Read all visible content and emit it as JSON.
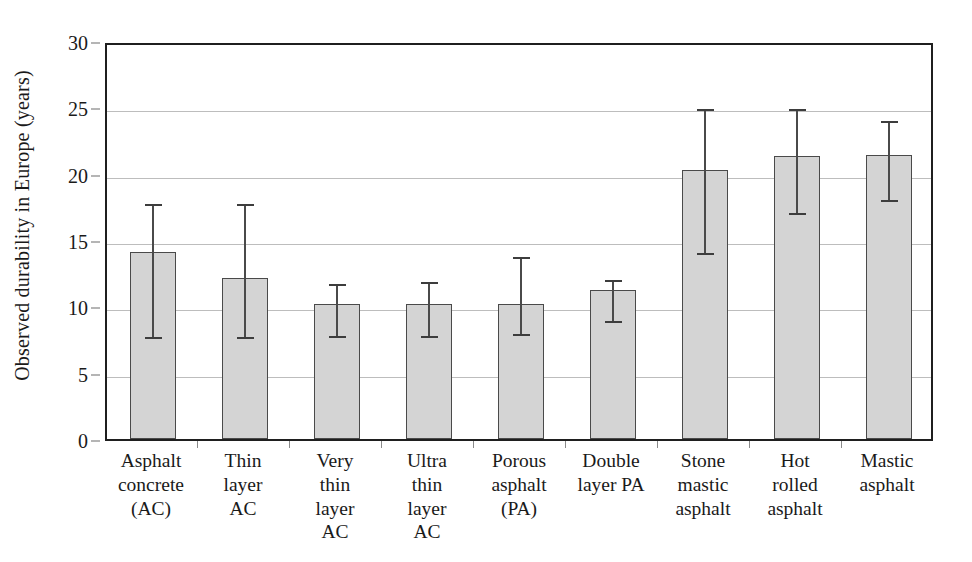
{
  "chart_data": {
    "type": "bar",
    "title": "",
    "subtitle": "",
    "xlabel": "",
    "ylabel": "Observed durability in Europe (years)",
    "ylim": [
      0,
      30
    ],
    "ytick_values": [
      0,
      5,
      10,
      15,
      20,
      25,
      30
    ],
    "ytick_labels": [
      "0",
      "5",
      "10",
      "15",
      "20",
      "25",
      "30"
    ],
    "grid": true,
    "legend": false,
    "error_bars": "asymmetric range (min-max)",
    "bar_color": "#d4d4d4",
    "bar_edge_color": "#4a4a4a",
    "error_color": "#3d3d3d",
    "grid_color": "#bdbdbd",
    "axis_color": "#1f1f1f",
    "categories": [
      "Asphalt\nconcrete\n(AC)",
      "Thin\nlayer\nAC",
      "Very\nthin\nlayer\nAC",
      "Ultra\nthin\nlayer\nAC",
      "Porous\nasphalt\n(PA)",
      "Double\nlayer PA",
      "Stone\nmastic\nasphalt",
      "Hot\nrolled\nasphalt",
      "Mastic\nasphalt"
    ],
    "category_lines": [
      [
        "Asphalt",
        "concrete",
        "(AC)"
      ],
      [
        "Thin",
        "layer",
        "AC"
      ],
      [
        "Very",
        "thin",
        "layer",
        "AC"
      ],
      [
        "Ultra",
        "thin",
        "layer",
        "AC"
      ],
      [
        "Porous",
        "asphalt",
        "(PA)"
      ],
      [
        "Double",
        "layer PA"
      ],
      [
        "Stone",
        "mastic",
        "asphalt"
      ],
      [
        "Hot",
        "rolled",
        "asphalt"
      ],
      [
        "Mastic",
        "asphalt"
      ]
    ],
    "values": [
      14.1,
      12.1,
      10.2,
      10.2,
      10.2,
      11.2,
      20.3,
      21.3,
      21.4
    ],
    "err_low": [
      8.0,
      8.0,
      8.1,
      8.1,
      8.2,
      9.2,
      14.3,
      17.3,
      18.3
    ],
    "err_high": [
      18.0,
      18.0,
      12.0,
      12.1,
      14.0,
      12.3,
      25.2,
      25.2,
      24.3
    ]
  }
}
